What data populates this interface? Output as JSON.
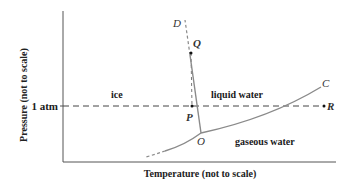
{
  "diagram": {
    "type": "phase_diagram",
    "subject": "water",
    "x_axis_label": "Temperature (not to scale)",
    "y_axis_label": "Pressure (not to scale)",
    "y_tick_label": "1 atm",
    "regions": {
      "ice": "ice",
      "liquid": "liquid water",
      "gas": "gaseous water"
    },
    "points": {
      "D": "D",
      "Q": "Q",
      "P": "P",
      "O": "O",
      "C": "C",
      "R": "R"
    },
    "colors": {
      "axis": "#555555",
      "curve": "#8a8a8a",
      "dashed": "#444444",
      "text": "#1a1a1a"
    }
  }
}
